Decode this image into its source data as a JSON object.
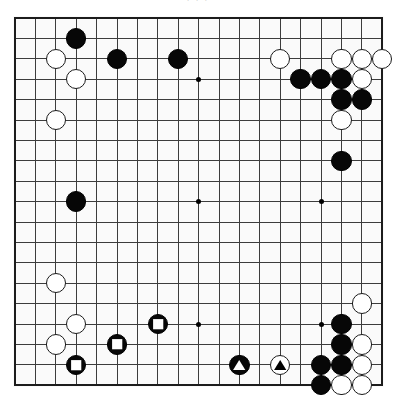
{
  "page": {
    "caption": "· · ·",
    "background_color": "#ffffff"
  },
  "board": {
    "name": "go-board",
    "size": 19,
    "board_color": "#fafafa",
    "line_color": "#3c3c3c",
    "edge_color": "#1c1c1c",
    "origin_x": 15,
    "origin_y": 18,
    "spacing": 20.4,
    "stone_radius": 10.2,
    "star_points": [
      {
        "col": 3,
        "row": 3
      },
      {
        "col": 9,
        "row": 3
      },
      {
        "col": 15,
        "row": 3
      },
      {
        "col": 3,
        "row": 9
      },
      {
        "col": 9,
        "row": 9
      },
      {
        "col": 15,
        "row": 9
      },
      {
        "col": 3,
        "row": 15
      },
      {
        "col": 9,
        "row": 15
      },
      {
        "col": 15,
        "row": 15
      }
    ],
    "stones": [
      {
        "col": 3,
        "row": 1,
        "color": "black",
        "mark": "none",
        "label": "black-stone"
      },
      {
        "col": 2,
        "row": 2,
        "color": "white",
        "mark": "none",
        "label": "white-stone"
      },
      {
        "col": 5,
        "row": 2,
        "color": "black",
        "mark": "none",
        "label": "black-stone"
      },
      {
        "col": 8,
        "row": 2,
        "color": "black",
        "mark": "none",
        "label": "black-stone"
      },
      {
        "col": 13,
        "row": 2,
        "color": "white",
        "mark": "none",
        "label": "white-stone"
      },
      {
        "col": 16,
        "row": 2,
        "color": "white",
        "mark": "none",
        "label": "white-stone"
      },
      {
        "col": 17,
        "row": 2,
        "color": "white",
        "mark": "none",
        "label": "white-stone"
      },
      {
        "col": 18,
        "row": 2,
        "color": "white",
        "mark": "none",
        "label": "white-stone"
      },
      {
        "col": 3,
        "row": 3,
        "color": "white",
        "mark": "none",
        "label": "white-stone"
      },
      {
        "col": 14,
        "row": 3,
        "color": "black",
        "mark": "none",
        "label": "black-stone"
      },
      {
        "col": 15,
        "row": 3,
        "color": "black",
        "mark": "none",
        "label": "black-stone"
      },
      {
        "col": 16,
        "row": 3,
        "color": "black",
        "mark": "none",
        "label": "black-stone"
      },
      {
        "col": 17,
        "row": 3,
        "color": "white",
        "mark": "none",
        "label": "white-stone"
      },
      {
        "col": 16,
        "row": 4,
        "color": "black",
        "mark": "none",
        "label": "black-stone"
      },
      {
        "col": 17,
        "row": 4,
        "color": "black",
        "mark": "none",
        "label": "black-stone"
      },
      {
        "col": 2,
        "row": 5,
        "color": "white",
        "mark": "none",
        "label": "white-stone"
      },
      {
        "col": 16,
        "row": 5,
        "color": "white",
        "mark": "none",
        "label": "white-stone"
      },
      {
        "col": 16,
        "row": 7,
        "color": "black",
        "mark": "none",
        "label": "black-stone"
      },
      {
        "col": 3,
        "row": 9,
        "color": "black",
        "mark": "none",
        "label": "black-stone"
      },
      {
        "col": 2,
        "row": 13,
        "color": "white",
        "mark": "none",
        "label": "white-stone"
      },
      {
        "col": 17,
        "row": 14,
        "color": "white",
        "mark": "none",
        "label": "white-stone"
      },
      {
        "col": 16,
        "row": 15,
        "color": "black",
        "mark": "none",
        "label": "black-stone"
      },
      {
        "col": 3,
        "row": 15,
        "color": "white",
        "mark": "none",
        "label": "white-stone"
      },
      {
        "col": 7,
        "row": 15,
        "color": "black",
        "mark": "square",
        "label": "black-stone-square-marked"
      },
      {
        "col": 2,
        "row": 16,
        "color": "white",
        "mark": "none",
        "label": "white-stone"
      },
      {
        "col": 5,
        "row": 16,
        "color": "black",
        "mark": "square",
        "label": "black-stone-square-marked"
      },
      {
        "col": 16,
        "row": 16,
        "color": "black",
        "mark": "none",
        "label": "black-stone"
      },
      {
        "col": 17,
        "row": 16,
        "color": "white",
        "mark": "none",
        "label": "white-stone"
      },
      {
        "col": 3,
        "row": 17,
        "color": "black",
        "mark": "square",
        "label": "black-stone-square-marked"
      },
      {
        "col": 11,
        "row": 17,
        "color": "black",
        "mark": "triangle",
        "label": "black-stone-triangle-marked"
      },
      {
        "col": 13,
        "row": 17,
        "color": "white",
        "mark": "triangle",
        "label": "white-stone-triangle-marked"
      },
      {
        "col": 15,
        "row": 17,
        "color": "black",
        "mark": "none",
        "label": "black-stone"
      },
      {
        "col": 16,
        "row": 17,
        "color": "black",
        "mark": "none",
        "label": "black-stone"
      },
      {
        "col": 17,
        "row": 17,
        "color": "white",
        "mark": "none",
        "label": "white-stone"
      },
      {
        "col": 15,
        "row": 18,
        "color": "black",
        "mark": "none",
        "label": "black-stone"
      },
      {
        "col": 16,
        "row": 18,
        "color": "white",
        "mark": "none",
        "label": "white-stone"
      },
      {
        "col": 17,
        "row": 18,
        "color": "white",
        "mark": "none",
        "label": "white-stone"
      }
    ]
  }
}
